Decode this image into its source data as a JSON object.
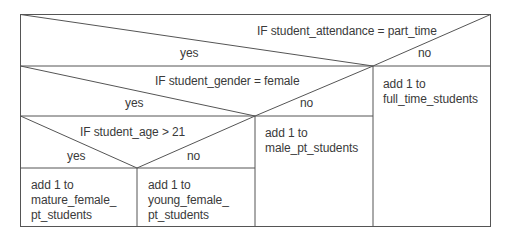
{
  "diagram": {
    "type": "nassi-shneiderman",
    "level1": {
      "condition": "IF student_attendance = part_time",
      "yes_label": "yes",
      "no_label": "no",
      "no_action": "add 1 to\nfull_time_students"
    },
    "level2": {
      "condition": "IF student_gender = female",
      "yes_label": "yes",
      "no_label": "no",
      "no_action": "add 1 to\nmale_pt_students"
    },
    "level3": {
      "condition": "IF student_age > 21",
      "yes_label": "yes",
      "no_label": "no",
      "yes_action": "add 1 to\nmature_female_\npt_students",
      "no_action": "add 1 to\nyoung_female_\npt_students"
    },
    "colors": {
      "line": "#555555",
      "text": "#3a3a3a",
      "background": "#ffffff"
    }
  }
}
